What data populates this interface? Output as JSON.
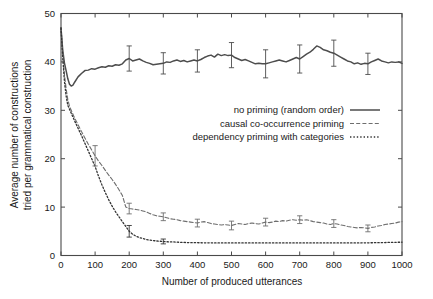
{
  "figure": {
    "background_color": "#ffffff",
    "axis_color": "#4a4a4a",
    "text_color": "#1a1a1a"
  },
  "chart_data": {
    "type": "line",
    "title": "",
    "subtitle": "",
    "xlabel": "Number of produced utterances",
    "ylabel": "Average number of constructions tried per grammatical construction",
    "ylabel_line1": "Average number of constructions",
    "ylabel_line2": "tried per grammatical construction",
    "xlim": [
      0,
      1000
    ],
    "ylim": [
      0,
      50
    ],
    "xticks": [
      0,
      100,
      200,
      300,
      400,
      500,
      600,
      700,
      800,
      900,
      1000
    ],
    "yticks": [
      0,
      10,
      20,
      30,
      40,
      50
    ],
    "xticklabels": [
      "0",
      "100",
      "200",
      "300",
      "400",
      "500",
      "600",
      "700",
      "800",
      "900",
      "1000"
    ],
    "yticklabels": [
      "0",
      "10",
      "20",
      "30",
      "40",
      "50"
    ],
    "grid": false,
    "legend_position": "center-right",
    "legend_entries": [
      "no priming (random order)",
      "causal co-occurrence priming",
      "dependency priming with categories"
    ],
    "series": [
      {
        "name": "no priming (random order)",
        "style": "solid",
        "color": "#4d4d4d",
        "width": 1.5,
        "x": [
          0,
          5,
          10,
          15,
          20,
          25,
          30,
          35,
          40,
          50,
          60,
          70,
          80,
          90,
          100,
          110,
          120,
          130,
          140,
          150,
          160,
          170,
          180,
          190,
          200,
          210,
          220,
          230,
          240,
          250,
          260,
          270,
          280,
          290,
          300,
          310,
          320,
          330,
          340,
          350,
          360,
          370,
          380,
          390,
          400,
          410,
          420,
          430,
          440,
          450,
          460,
          470,
          480,
          490,
          500,
          510,
          520,
          530,
          540,
          550,
          560,
          570,
          580,
          590,
          600,
          610,
          620,
          630,
          640,
          650,
          660,
          670,
          680,
          690,
          700,
          710,
          720,
          730,
          740,
          750,
          760,
          770,
          780,
          790,
          800,
          810,
          820,
          830,
          840,
          850,
          860,
          870,
          880,
          890,
          900,
          910,
          920,
          930,
          940,
          950,
          960,
          970,
          980,
          990,
          1000
        ],
        "y": [
          47.0,
          42.5,
          39.8,
          38.2,
          36.5,
          35.4,
          35.0,
          35.2,
          35.8,
          36.9,
          37.6,
          38.2,
          38.3,
          38.6,
          38.5,
          38.8,
          39.0,
          38.9,
          39.2,
          39.1,
          39.4,
          39.3,
          39.6,
          40.4,
          40.7,
          40.2,
          40.4,
          40.6,
          40.2,
          39.9,
          39.7,
          39.4,
          39.5,
          39.6,
          39.7,
          40.0,
          39.9,
          40.2,
          40.4,
          40.1,
          40.3,
          40.0,
          40.2,
          40.4,
          40.2,
          40.5,
          40.9,
          41.2,
          41.4,
          41.0,
          41.6,
          41.3,
          41.5,
          41.3,
          41.4,
          40.9,
          40.6,
          40.3,
          40.5,
          40.2,
          39.9,
          39.6,
          39.7,
          39.6,
          39.6,
          39.8,
          40.0,
          40.2,
          40.4,
          40.2,
          40.0,
          40.3,
          40.6,
          40.9,
          40.6,
          41.1,
          41.6,
          42.0,
          42.6,
          43.3,
          43.0,
          42.5,
          42.3,
          42.0,
          41.8,
          41.4,
          41.0,
          40.6,
          40.2,
          40.0,
          39.6,
          39.8,
          39.5,
          39.7,
          39.6,
          40.0,
          40.3,
          40.6,
          40.2,
          40.0,
          39.8,
          40.0,
          39.9,
          40.0,
          39.7
        ],
        "errorbars": [
          {
            "x": 200,
            "y": 40.7,
            "err": 2.6
          },
          {
            "x": 300,
            "y": 39.7,
            "err": 2.2
          },
          {
            "x": 400,
            "y": 40.2,
            "err": 2.3
          },
          {
            "x": 500,
            "y": 41.4,
            "err": 2.6
          },
          {
            "x": 600,
            "y": 39.6,
            "err": 2.9
          },
          {
            "x": 700,
            "y": 40.6,
            "err": 2.9
          },
          {
            "x": 800,
            "y": 41.8,
            "err": 2.7
          },
          {
            "x": 900,
            "y": 39.6,
            "err": 2.2
          }
        ]
      },
      {
        "name": "causal co-occurrence priming",
        "style": "dashed",
        "color": "#6e6e6e",
        "width": 1.1,
        "x": [
          0,
          5,
          10,
          15,
          20,
          25,
          30,
          35,
          40,
          50,
          60,
          70,
          80,
          90,
          100,
          110,
          120,
          130,
          140,
          150,
          160,
          170,
          180,
          190,
          200,
          210,
          220,
          230,
          240,
          250,
          260,
          270,
          280,
          290,
          300,
          310,
          320,
          330,
          340,
          350,
          360,
          370,
          380,
          390,
          400,
          410,
          420,
          430,
          440,
          450,
          460,
          470,
          480,
          490,
          500,
          510,
          520,
          530,
          540,
          550,
          560,
          570,
          580,
          590,
          600,
          610,
          620,
          630,
          640,
          650,
          660,
          670,
          680,
          690,
          700,
          710,
          720,
          730,
          740,
          750,
          760,
          770,
          780,
          790,
          800,
          810,
          820,
          830,
          840,
          850,
          860,
          870,
          880,
          890,
          900,
          910,
          920,
          930,
          940,
          950,
          960,
          970,
          980,
          990,
          1000
        ],
        "y": [
          47.0,
          42.0,
          37.5,
          34.5,
          32.2,
          30.8,
          30.0,
          29.2,
          28.4,
          27.0,
          25.6,
          24.3,
          23.0,
          21.8,
          20.6,
          19.5,
          18.6,
          17.6,
          16.6,
          15.7,
          14.7,
          13.6,
          12.4,
          10.0,
          9.7,
          9.6,
          9.5,
          9.4,
          9.2,
          9.0,
          8.7,
          8.4,
          8.2,
          8.1,
          8.0,
          7.8,
          7.6,
          7.5,
          7.4,
          7.2,
          7.1,
          7.0,
          6.9,
          6.8,
          6.7,
          6.9,
          7.0,
          6.8,
          6.6,
          6.5,
          6.4,
          6.3,
          6.4,
          6.3,
          6.2,
          6.4,
          6.6,
          6.5,
          6.4,
          6.6,
          6.7,
          6.6,
          6.5,
          6.7,
          6.9,
          6.8,
          6.9,
          7.1,
          7.0,
          7.2,
          7.1,
          7.3,
          7.4,
          7.3,
          7.4,
          7.3,
          7.4,
          7.2,
          7.0,
          6.9,
          6.8,
          6.7,
          6.5,
          6.4,
          6.6,
          6.5,
          6.3,
          6.2,
          6.0,
          5.9,
          5.8,
          5.7,
          5.8,
          5.7,
          5.6,
          5.8,
          5.9,
          6.1,
          6.2,
          6.4,
          6.5,
          6.6,
          6.7,
          6.9,
          7.0
        ],
        "errorbars": [
          {
            "x": 100,
            "y": 20.6,
            "err": 2.1
          },
          {
            "x": 200,
            "y": 9.7,
            "err": 1.1
          },
          {
            "x": 300,
            "y": 8.0,
            "err": 0.8
          },
          {
            "x": 400,
            "y": 6.7,
            "err": 0.8
          },
          {
            "x": 500,
            "y": 6.2,
            "err": 0.9
          },
          {
            "x": 600,
            "y": 6.9,
            "err": 0.8
          },
          {
            "x": 700,
            "y": 7.4,
            "err": 0.8
          },
          {
            "x": 800,
            "y": 6.6,
            "err": 0.8
          },
          {
            "x": 900,
            "y": 5.6,
            "err": 0.7
          }
        ]
      },
      {
        "name": "dependency priming with categories",
        "style": "dotted",
        "color": "#333333",
        "width": 1.3,
        "x": [
          0,
          5,
          10,
          15,
          20,
          25,
          30,
          35,
          40,
          50,
          60,
          70,
          80,
          90,
          100,
          110,
          120,
          130,
          140,
          150,
          160,
          170,
          180,
          190,
          200,
          210,
          220,
          230,
          240,
          250,
          260,
          270,
          280,
          290,
          300,
          310,
          320,
          330,
          340,
          350,
          360,
          370,
          380,
          390,
          400,
          410,
          420,
          430,
          440,
          450,
          460,
          470,
          480,
          490,
          500,
          510,
          520,
          530,
          540,
          550,
          560,
          570,
          580,
          590,
          600,
          610,
          620,
          630,
          640,
          650,
          660,
          670,
          680,
          690,
          700,
          710,
          720,
          730,
          740,
          750,
          760,
          770,
          780,
          790,
          800,
          810,
          820,
          830,
          840,
          850,
          860,
          870,
          880,
          890,
          900,
          910,
          920,
          930,
          940,
          950,
          960,
          970,
          980,
          990,
          1000
        ],
        "y": [
          47.0,
          41.0,
          36.0,
          33.0,
          31.0,
          30.2,
          29.4,
          28.6,
          27.8,
          26.3,
          24.8,
          23.2,
          21.6,
          20.0,
          18.4,
          16.4,
          14.6,
          13.0,
          11.5,
          10.2,
          9.0,
          8.0,
          7.0,
          6.0,
          5.0,
          4.4,
          4.0,
          3.7,
          3.5,
          3.3,
          3.2,
          3.1,
          3.0,
          2.95,
          2.9,
          2.85,
          2.8,
          2.8,
          2.75,
          2.72,
          2.7,
          2.68,
          2.66,
          2.65,
          2.64,
          2.63,
          2.62,
          2.62,
          2.61,
          2.6,
          2.6,
          2.6,
          2.6,
          2.6,
          2.6,
          2.6,
          2.6,
          2.6,
          2.6,
          2.6,
          2.6,
          2.6,
          2.6,
          2.6,
          2.6,
          2.6,
          2.6,
          2.6,
          2.6,
          2.6,
          2.6,
          2.6,
          2.6,
          2.6,
          2.6,
          2.6,
          2.6,
          2.6,
          2.6,
          2.6,
          2.6,
          2.6,
          2.6,
          2.6,
          2.6,
          2.6,
          2.6,
          2.6,
          2.6,
          2.6,
          2.6,
          2.6,
          2.6,
          2.62,
          2.62,
          2.63,
          2.64,
          2.65,
          2.66,
          2.68,
          2.7,
          2.7,
          2.72,
          2.74,
          2.75
        ],
        "errorbars": [
          {
            "x": 200,
            "y": 5.0,
            "err": 1.2
          },
          {
            "x": 300,
            "y": 2.9,
            "err": 0.5
          }
        ]
      }
    ]
  }
}
